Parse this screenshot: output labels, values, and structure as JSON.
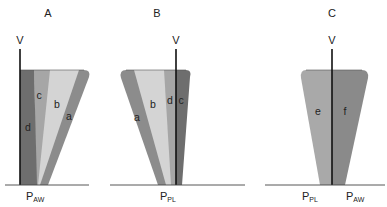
{
  "panels": [
    {
      "id": "A",
      "title": "A",
      "axis_label": "V",
      "pressure_label_main": "P",
      "pressure_label_sub": "AW",
      "segments": [
        {
          "label": "d",
          "color": "#6e6e6e"
        },
        {
          "label": "c",
          "color": "#a6a6a6"
        },
        {
          "label": "b",
          "color": "#d4d4d4"
        },
        {
          "label": "a",
          "color": "#8c8c8c"
        }
      ]
    },
    {
      "id": "B",
      "title": "B",
      "axis_label": "V",
      "pressure_label_main": "P",
      "pressure_label_sub": "PL",
      "segments": [
        {
          "label": "a",
          "color": "#8c8c8c"
        },
        {
          "label": "b",
          "color": "#d4d4d4"
        },
        {
          "label": "d",
          "color": "#a6a6a6"
        },
        {
          "label": "c",
          "color": "#6e6e6e"
        }
      ]
    },
    {
      "id": "C",
      "title": "C",
      "axis_label": "V",
      "left_pressure_main": "P",
      "left_pressure_sub": "PL",
      "right_pressure_main": "P",
      "right_pressure_sub": "AW",
      "segments": [
        {
          "label": "e",
          "color": "#a9a9a9"
        },
        {
          "label": "f",
          "color": "#8a8a8a"
        }
      ]
    }
  ],
  "colors": {
    "axis": "#111111",
    "baseline": "#444444"
  }
}
